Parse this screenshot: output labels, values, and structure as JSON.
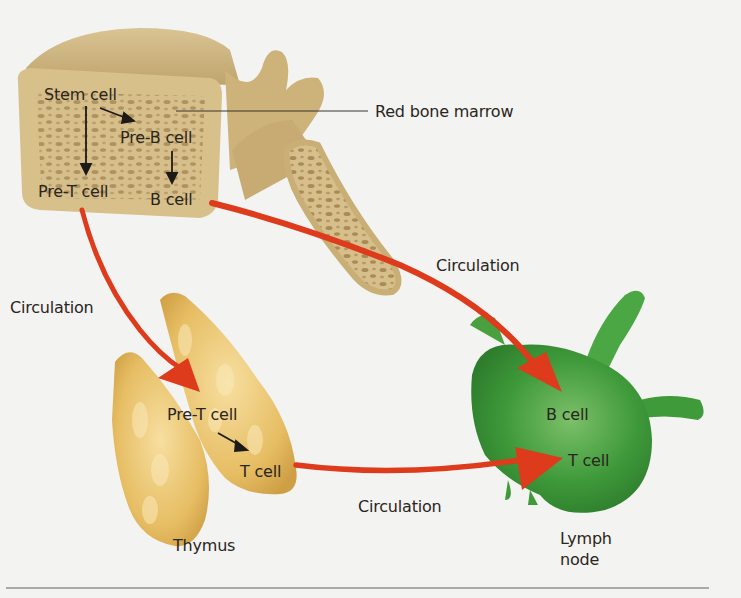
{
  "diagram": {
    "type": "flow",
    "title": "",
    "nodes": [
      {
        "id": "red-bone-marrow",
        "label": "Red bone marrow",
        "kind": "organ"
      },
      {
        "id": "stem-cell",
        "label": "Stem cell",
        "location": "red-bone-marrow"
      },
      {
        "id": "pre-b-cell-marrow",
        "label": "Pre-B cell",
        "location": "red-bone-marrow"
      },
      {
        "id": "pre-t-cell-marrow",
        "label": "Pre-T cell",
        "location": "red-bone-marrow"
      },
      {
        "id": "b-cell-marrow",
        "label": "B cell",
        "location": "red-bone-marrow"
      },
      {
        "id": "thymus",
        "label": "Thymus",
        "kind": "organ"
      },
      {
        "id": "pre-t-cell-thymus",
        "label": "Pre-T cell",
        "location": "thymus"
      },
      {
        "id": "t-cell-thymus",
        "label": "T cell",
        "location": "thymus"
      },
      {
        "id": "lymph-node",
        "label": "Lymph node",
        "kind": "organ"
      },
      {
        "id": "b-cell-lymph",
        "label": "B cell",
        "location": "lymph-node"
      },
      {
        "id": "t-cell-lymph",
        "label": "T cell",
        "location": "lymph-node"
      }
    ],
    "edges": [
      {
        "from": "stem-cell",
        "to": "pre-b-cell-marrow",
        "style": "black-arrow"
      },
      {
        "from": "stem-cell",
        "to": "pre-t-cell-marrow",
        "style": "black-arrow"
      },
      {
        "from": "pre-b-cell-marrow",
        "to": "b-cell-marrow",
        "style": "black-arrow"
      },
      {
        "from": "pre-t-cell-marrow",
        "to": "pre-t-cell-thymus",
        "label": "Circulation",
        "style": "red-arrow"
      },
      {
        "from": "b-cell-marrow",
        "to": "b-cell-lymph",
        "label": "Circulation",
        "style": "red-arrow"
      },
      {
        "from": "pre-t-cell-thymus",
        "to": "t-cell-thymus",
        "style": "black-arrow"
      },
      {
        "from": "t-cell-thymus",
        "to": "t-cell-lymph",
        "label": "Circulation",
        "style": "red-arrow"
      }
    ]
  },
  "labels": {
    "red_bone_marrow": "Red bone marrow",
    "stem_cell": "Stem cell",
    "pre_b_cell": "Pre-B cell",
    "pre_t_cell_marrow": "Pre-T cell",
    "b_cell_marrow": "B cell",
    "circulation_left": "Circulation",
    "circulation_right": "Circulation",
    "circulation_bottom": "Circulation",
    "pre_t_cell_thymus": "Pre-T cell",
    "t_cell_thymus": "T cell",
    "thymus": "Thymus",
    "b_cell_lymph": "B cell",
    "t_cell_lymph": "T cell",
    "lymph_line1": "Lymph",
    "lymph_line2": "node"
  },
  "colors": {
    "background": "#f3f3f1",
    "bone": "#d9c08a",
    "bone_shade": "#b89a5e",
    "marrow_spots": "#9c7f4f",
    "thymus": "#e8c068",
    "lymph_node": "#3f9a3a",
    "arrow_red": "#dd3b1c",
    "text": "#2a2520"
  }
}
